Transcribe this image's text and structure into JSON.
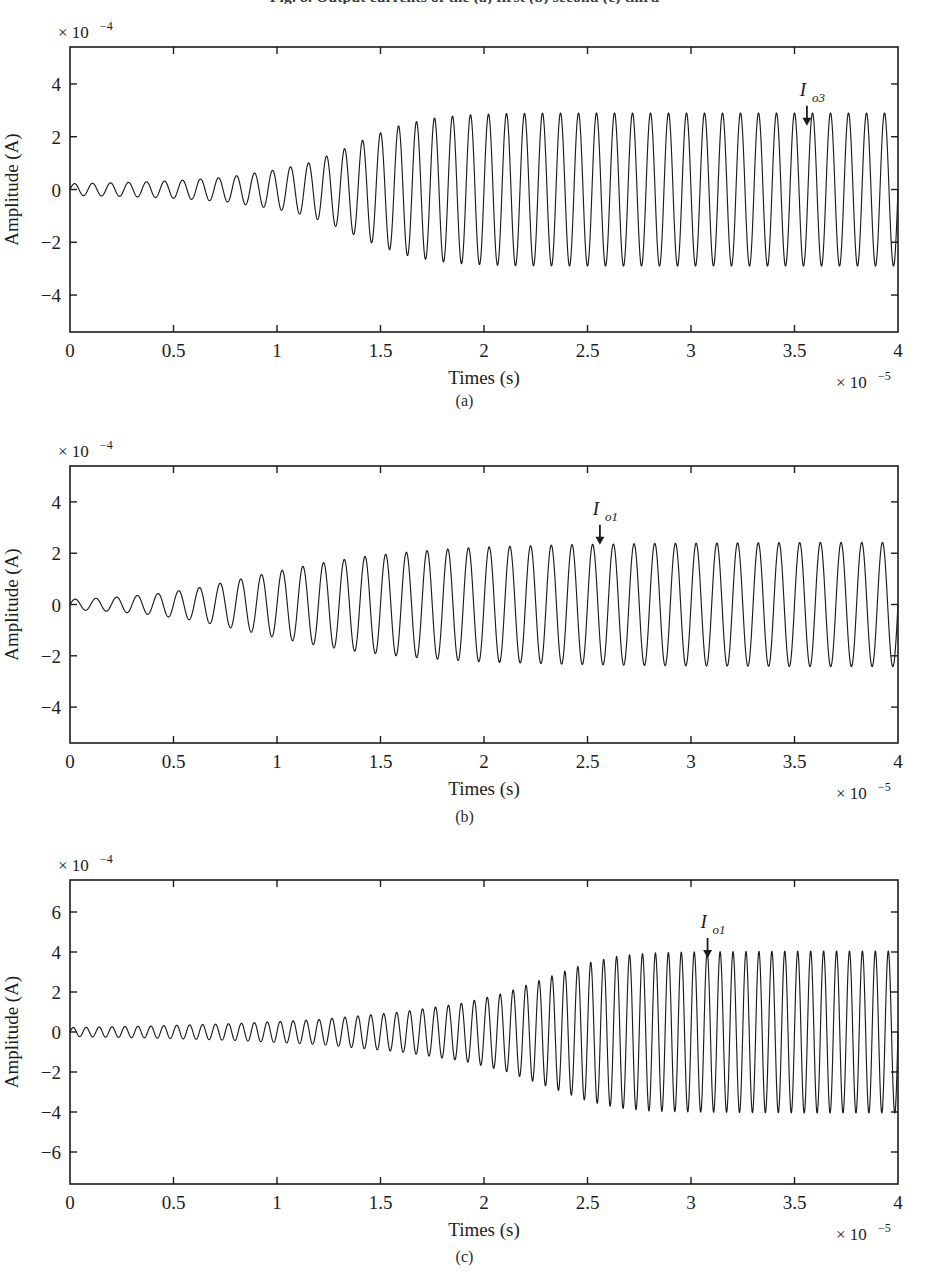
{
  "figure": {
    "cut_caption": "Fig. 8.  Output currents of the  (a)   first  (b)   second  (c)   third",
    "line_color": "#1c1c1c",
    "axis_color": "#1c1c1c"
  },
  "panels": [
    {
      "id": "a",
      "subcaption": "(a)",
      "xlabel": "Times (s)",
      "ylabel": "Amplitude (A)",
      "y_multiplier": "× 10",
      "y_multiplier_exp": "-4",
      "x_multiplier": "× 10",
      "x_multiplier_exp": "-5",
      "annotation": {
        "base": "I",
        "sub": "o3",
        "x": 3.56,
        "y": 3.55
      }
    },
    {
      "id": "b",
      "subcaption": "(b)",
      "xlabel": "Times (s)",
      "ylabel": "Amplitude (A)",
      "y_multiplier": "× 10",
      "y_multiplier_exp": "-4",
      "x_multiplier": "× 10",
      "x_multiplier_exp": "-5",
      "annotation": {
        "base": "I",
        "sub": "o1",
        "x": 2.56,
        "y": 3.5
      }
    },
    {
      "id": "c",
      "subcaption": "(c)",
      "xlabel": "Times (s)",
      "ylabel": "Amplitude (A)",
      "y_multiplier": "× 10",
      "y_multiplier_exp": "-4",
      "x_multiplier": "× 10",
      "x_multiplier_exp": "-5",
      "annotation": {
        "base": "I",
        "sub": "o1",
        "x": 3.08,
        "y": 5.2
      }
    }
  ],
  "chart_data": [
    {
      "type": "line",
      "panel": "a",
      "title": "",
      "xlabel": "Times (s)",
      "ylabel": "Amplitude (A)",
      "x_scale_exponent": -5,
      "y_scale_exponent": -4,
      "xlim": [
        0,
        4
      ],
      "ylim": [
        -5.4,
        5.4
      ],
      "xticks": [
        0,
        0.5,
        1,
        1.5,
        2,
        2.5,
        3,
        3.5,
        4
      ],
      "xticklabels": [
        "0",
        "0.5",
        "1",
        "1.5",
        "2",
        "2.5",
        "3",
        "3.5",
        "4"
      ],
      "yticks": [
        -4,
        -2,
        0,
        2,
        4
      ],
      "yticklabels": [
        "-4",
        "-2",
        "0",
        "2",
        "4"
      ],
      "grid": false,
      "legend": null,
      "annotations": [
        {
          "text": "I_o3",
          "x": 3.56,
          "y": 3.55,
          "arrow": "down"
        }
      ],
      "series": [
        {
          "name": "I_o3",
          "waveform": "amplitude-modulated sinusoid",
          "cycles_over_range": 46,
          "initial_amplitude": 0.22,
          "saturation_amplitude": 2.9,
          "growth_midpoint_x": 1.45,
          "growth_rate": 2.6,
          "envelope_x": [
            0,
            0.25,
            0.5,
            0.75,
            1.0,
            1.15,
            1.3,
            1.45,
            1.6,
            1.75,
            1.9,
            2.1,
            2.4,
            3.0,
            3.5,
            4.0
          ],
          "envelope_y": [
            0.22,
            0.26,
            0.33,
            0.46,
            0.75,
            1.0,
            1.45,
            2.0,
            2.45,
            2.7,
            2.82,
            2.88,
            2.9,
            2.9,
            2.9,
            2.9
          ]
        }
      ]
    },
    {
      "type": "line",
      "panel": "b",
      "title": "",
      "xlabel": "Times (s)",
      "ylabel": "Amplitude (A)",
      "x_scale_exponent": -5,
      "y_scale_exponent": -4,
      "xlim": [
        0,
        4
      ],
      "ylim": [
        -5.4,
        5.4
      ],
      "xticks": [
        0,
        0.5,
        1,
        1.5,
        2,
        2.5,
        3,
        3.5,
        4
      ],
      "xticklabels": [
        "0",
        "0.5",
        "1",
        "1.5",
        "2",
        "2.5",
        "3",
        "3.5",
        "4"
      ],
      "yticks": [
        -4,
        -2,
        0,
        2,
        4
      ],
      "yticklabels": [
        "-4",
        "-2",
        "0",
        "2",
        "4"
      ],
      "grid": false,
      "legend": null,
      "annotations": [
        {
          "text": "I_o1",
          "x": 2.56,
          "y": 3.5,
          "arrow": "down"
        }
      ],
      "series": [
        {
          "name": "I_o1",
          "waveform": "amplitude-modulated sinusoid",
          "cycles_over_range": 40,
          "initial_amplitude": 0.2,
          "saturation_amplitude": 2.42,
          "growth_midpoint_x": 1.0,
          "growth_rate": 1.7,
          "envelope_x": [
            0,
            0.2,
            0.4,
            0.6,
            0.8,
            1.0,
            1.2,
            1.4,
            1.6,
            1.8,
            2.0,
            2.4,
            2.8,
            3.2,
            3.6,
            4.0
          ],
          "envelope_y": [
            0.2,
            0.27,
            0.4,
            0.62,
            0.95,
            1.3,
            1.6,
            1.85,
            2.02,
            2.15,
            2.24,
            2.33,
            2.38,
            2.4,
            2.42,
            2.42
          ]
        }
      ]
    },
    {
      "type": "line",
      "panel": "c",
      "title": "",
      "xlabel": "Times (s)",
      "ylabel": "Amplitude (A)",
      "x_scale_exponent": -5,
      "y_scale_exponent": -4,
      "xlim": [
        0,
        4
      ],
      "ylim": [
        -7.6,
        7.6
      ],
      "xticks": [
        0,
        0.5,
        1,
        1.5,
        2,
        2.5,
        3,
        3.5,
        4
      ],
      "xticklabels": [
        "0",
        "0.5",
        "1",
        "1.5",
        "2",
        "2.5",
        "3",
        "3.5",
        "4"
      ],
      "yticks": [
        -6,
        -4,
        -2,
        0,
        2,
        4,
        6
      ],
      "yticklabels": [
        "-6",
        "-4",
        "-2",
        "0",
        "2",
        "4",
        "6"
      ],
      "grid": false,
      "legend": null,
      "annotations": [
        {
          "text": "I_o1",
          "x": 3.08,
          "y": 5.2,
          "arrow": "down"
        }
      ],
      "series": [
        {
          "name": "I_o1",
          "waveform": "amplitude-modulated sinusoid",
          "cycles_over_range": 64,
          "initial_amplitude": 0.22,
          "saturation_amplitude": 4.05,
          "growth_midpoint_x": 2.25,
          "growth_rate": 2.2,
          "envelope_x": [
            0,
            0.4,
            0.8,
            1.2,
            1.6,
            1.9,
            2.1,
            2.3,
            2.5,
            2.65,
            2.8,
            3.0,
            3.3,
            3.6,
            3.8,
            4.0
          ],
          "envelope_y": [
            0.22,
            0.3,
            0.42,
            0.62,
            1.0,
            1.45,
            1.95,
            2.7,
            3.45,
            3.8,
            3.95,
            4.0,
            4.03,
            4.05,
            4.05,
            4.05
          ]
        }
      ]
    }
  ]
}
